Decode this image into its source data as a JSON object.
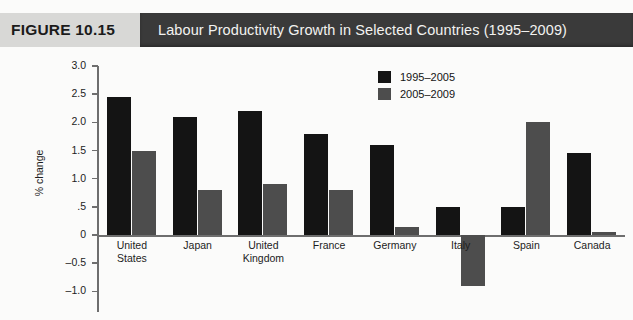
{
  "header": {
    "figure_label": "FIGURE 10.15",
    "title": "Labour Productivity Growth in Selected Countries (1995–2009)",
    "band_color": "#3a3a3a",
    "figure_box_color": "#d8d8d6"
  },
  "chart_data": {
    "type": "bar",
    "title": "Labour Productivity Growth in Selected Countries (1995–2009)",
    "xlabel": "",
    "ylabel": "% change",
    "ylim": [
      -1.0,
      3.0
    ],
    "ytick_labels": [
      "3.0",
      "2.5",
      "2.0",
      "1.5",
      "1.0",
      ".5",
      "0",
      "–0.5",
      "–1.0"
    ],
    "ytick_values": [
      3.0,
      2.5,
      2.0,
      1.5,
      1.0,
      0.5,
      0,
      -0.5,
      -1.0
    ],
    "grid": false,
    "legend_position": "upper-right-inside",
    "categories": [
      "United States",
      "Japan",
      "United Kingdom",
      "France",
      "Germany",
      "Italy",
      "Spain",
      "Canada"
    ],
    "series": [
      {
        "name": "1995–2005",
        "color": "#141414",
        "values": [
          2.45,
          2.1,
          2.2,
          1.8,
          1.6,
          0.5,
          0.5,
          1.45
        ]
      },
      {
        "name": "2005–2009",
        "color": "#4d4d4d",
        "values": [
          1.5,
          0.8,
          0.9,
          0.8,
          0.15,
          -0.9,
          2.0,
          0.05
        ]
      }
    ]
  }
}
